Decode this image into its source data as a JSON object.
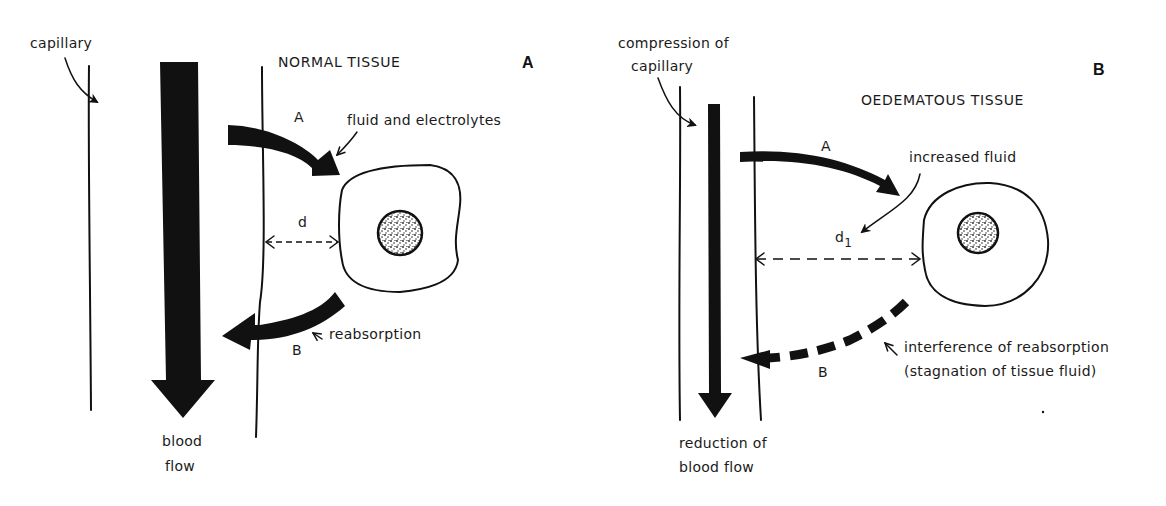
{
  "figure": {
    "panels": [
      {
        "id": "A",
        "panel_letter": "A",
        "title": "NORMAL TISSUE",
        "labels": {
          "capillary": "capillary",
          "fluid": "fluid and electrolytes",
          "arrow_a": "A",
          "arrow_b": "B",
          "distance": "d",
          "reabsorption": "reabsorption",
          "blood_flow_line1": "blood",
          "blood_flow_line2": "flow"
        }
      },
      {
        "id": "B",
        "panel_letter": "B",
        "title": "OEDEMATOUS TISSUE",
        "labels": {
          "compression_line1": "compression of",
          "compression_line2": "capillary",
          "increased_fluid": "increased fluid",
          "arrow_a": "A",
          "arrow_b": "B",
          "distance": "d",
          "distance_sub": "1",
          "interference_line1": "interference of reabsorption",
          "interference_line2": "(stagnation of tissue fluid)",
          "reduction_line1": "reduction of",
          "reduction_line2": "blood flow"
        }
      }
    ],
    "colors": {
      "ink": "#111111",
      "background": "#ffffff"
    }
  }
}
